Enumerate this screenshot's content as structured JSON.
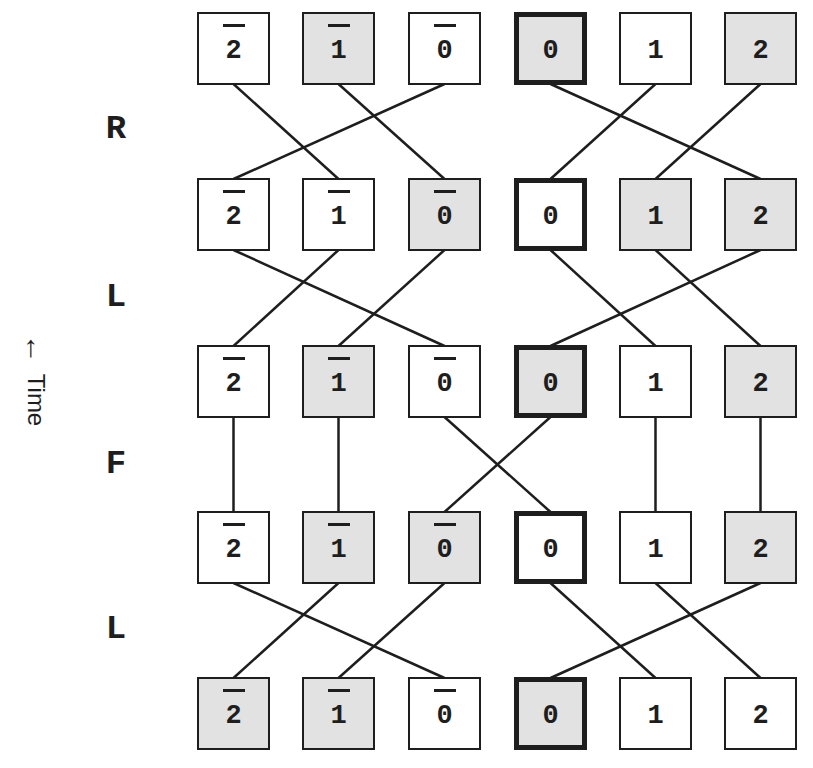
{
  "diagram": {
    "time_axis": {
      "arrow_icon": "←",
      "label": "Time"
    },
    "column_labels": [
      "2̄",
      "1̄",
      "0̄",
      "0",
      "1",
      "2"
    ],
    "columns": [
      {
        "digit": "2",
        "overbar": true
      },
      {
        "digit": "1",
        "overbar": true
      },
      {
        "digit": "0",
        "overbar": true
      },
      {
        "digit": "0",
        "overbar": false
      },
      {
        "digit": "1",
        "overbar": false
      },
      {
        "digit": "2",
        "overbar": false
      }
    ],
    "operations": [
      "R",
      "L",
      "F",
      "L"
    ],
    "rows": [
      {
        "shaded": [
          false,
          true,
          false,
          true,
          false,
          true
        ],
        "thick": [
          false,
          false,
          false,
          true,
          false,
          false
        ]
      },
      {
        "shaded": [
          false,
          false,
          true,
          false,
          true,
          true
        ],
        "thick": [
          false,
          false,
          false,
          true,
          false,
          false
        ]
      },
      {
        "shaded": [
          false,
          true,
          false,
          true,
          false,
          true
        ],
        "thick": [
          false,
          false,
          false,
          true,
          false,
          false
        ]
      },
      {
        "shaded": [
          false,
          true,
          true,
          false,
          false,
          true
        ],
        "thick": [
          false,
          false,
          false,
          true,
          false,
          false
        ]
      },
      {
        "shaded": [
          true,
          true,
          false,
          true,
          false,
          false
        ],
        "thick": [
          false,
          false,
          false,
          true,
          false,
          false
        ]
      }
    ],
    "transitions": [
      {
        "operation": "R",
        "map": [
          1,
          2,
          0,
          5,
          3,
          4
        ]
      },
      {
        "operation": "L",
        "map": [
          2,
          0,
          1,
          4,
          5,
          3
        ]
      },
      {
        "operation": "F",
        "map": [
          0,
          1,
          3,
          2,
          4,
          5
        ]
      },
      {
        "operation": "L",
        "map": [
          2,
          0,
          1,
          4,
          5,
          3
        ]
      }
    ],
    "colors": {
      "stroke": "#1e1e1e",
      "shade": "#e2e2e2",
      "background": "#ffffff"
    }
  }
}
